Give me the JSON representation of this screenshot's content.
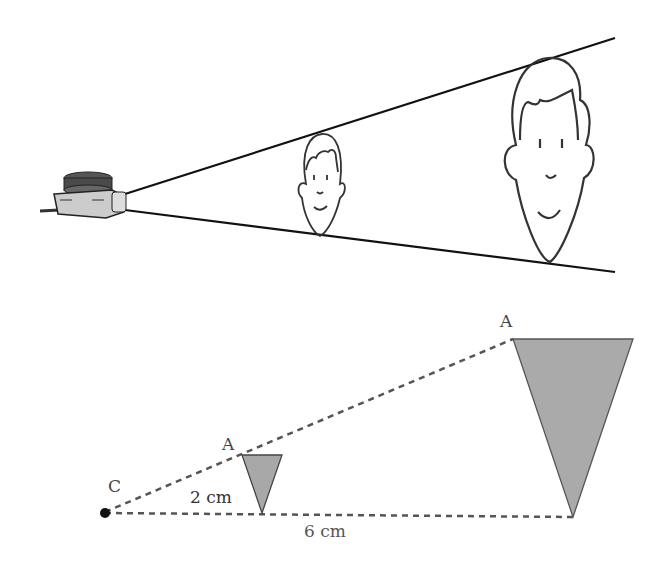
{
  "top_illustration": {
    "description": "Projector casting enlarged face images",
    "objects": [
      "projector",
      "small-face",
      "large-face"
    ]
  },
  "diagram": {
    "center_label": "C",
    "small_triangle_vertex_label": "A",
    "large_triangle_vertex_label": "A",
    "small_distance_label": "2 cm",
    "large_distance_label": "6 cm"
  },
  "colors": {
    "line": "#111111",
    "dash": "#555555",
    "triangle_fill": "#a8a8a8",
    "triangle_stroke": "#555555"
  }
}
